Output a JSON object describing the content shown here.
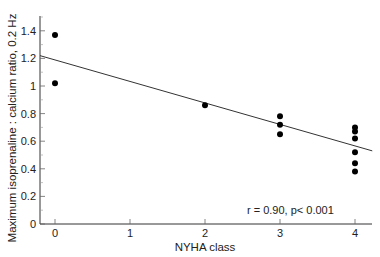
{
  "chart_data": {
    "type": "scatter",
    "title": "",
    "xlabel": "NYHA class",
    "ylabel": "Maximum isoprenaline : calcium ratio, 0.2 Hz",
    "xlim": [
      -0.2,
      4.23
    ],
    "ylim": [
      0,
      1.5
    ],
    "x_ticks": [
      0,
      1,
      2,
      3,
      4
    ],
    "x_tick_labels": [
      "0",
      "1",
      "2",
      "3",
      "4"
    ],
    "y_ticks": [
      0,
      0.2,
      0.4,
      0.6,
      0.8,
      1.0,
      1.2,
      1.4
    ],
    "y_tick_labels": [
      "0",
      "0.2",
      "0.4",
      "0.6",
      "0.8",
      "1",
      "1.2",
      "1.4"
    ],
    "grid": false,
    "legend": null,
    "series": [
      {
        "name": "data",
        "points": [
          {
            "x": 0,
            "y": 1.37
          },
          {
            "x": 0,
            "y": 1.02
          },
          {
            "x": 2,
            "y": 0.86
          },
          {
            "x": 3,
            "y": 0.78
          },
          {
            "x": 3,
            "y": 0.72
          },
          {
            "x": 3,
            "y": 0.65
          },
          {
            "x": 4,
            "y": 0.7
          },
          {
            "x": 4,
            "y": 0.67
          },
          {
            "x": 4,
            "y": 0.62
          },
          {
            "x": 4,
            "y": 0.52
          },
          {
            "x": 4,
            "y": 0.44
          },
          {
            "x": 4,
            "y": 0.38
          }
        ]
      }
    ],
    "regression_line": {
      "x0": -0.2,
      "y0": 1.22,
      "x1": 4.23,
      "y1": 0.53
    },
    "annotations": [
      "r = 0.90, p< 0.001"
    ]
  }
}
